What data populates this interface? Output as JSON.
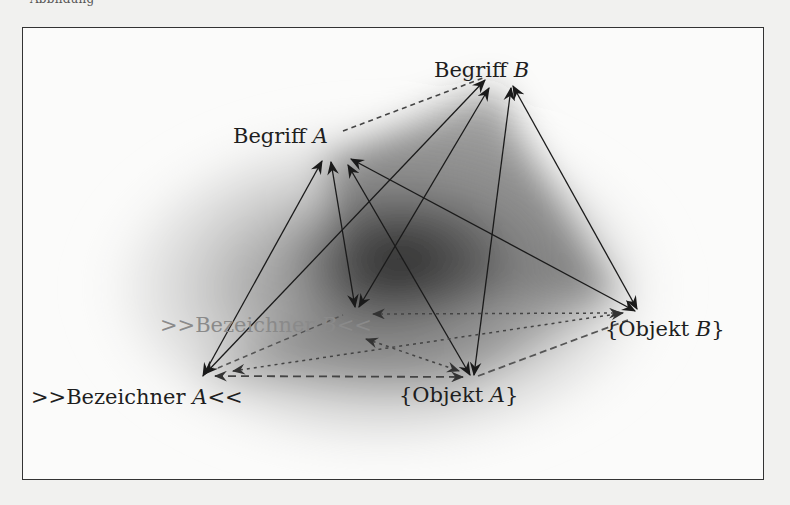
{
  "page": {
    "header_fragment": "Abbildung"
  },
  "diagram": {
    "nodes": {
      "begriff_a": {
        "text": "Begriff ",
        "var": "A"
      },
      "begriff_b": {
        "text": "Begriff ",
        "var": "B"
      },
      "bezeichner_a": {
        "prefix": ">>Bezeichner ",
        "var": "A",
        "suffix": "<<"
      },
      "bezeichner_b": {
        "prefix": ">>Bezeichner ",
        "var": "B",
        "suffix": "<<"
      },
      "objekt_a": {
        "prefix": "{Objekt ",
        "var": "A",
        "suffix": "}"
      },
      "objekt_b": {
        "prefix": "{Objekt ",
        "var": "B",
        "suffix": "}"
      }
    },
    "edges": [
      {
        "from": "Begriff A",
        "to": "Begriff B",
        "style": "dashed"
      },
      {
        "from": ">>Bezeichner A<<",
        "to": "Begriff A",
        "style": "solid",
        "arrows": "both"
      },
      {
        "from": ">>Bezeichner A<<",
        "to": "Begriff B",
        "style": "solid",
        "arrows": "both"
      },
      {
        "from": ">>Bezeichner B<<",
        "to": "Begriff A",
        "style": "solid",
        "arrows": "both"
      },
      {
        "from": ">>Bezeichner B<<",
        "to": "Begriff B",
        "style": "solid",
        "arrows": "both"
      },
      {
        "from": "{Objekt A}",
        "to": "Begriff A",
        "style": "solid",
        "arrows": "both"
      },
      {
        "from": "{Objekt A}",
        "to": "Begriff B",
        "style": "solid",
        "arrows": "both"
      },
      {
        "from": "{Objekt B}",
        "to": "Begriff A",
        "style": "solid",
        "arrows": "both"
      },
      {
        "from": "{Objekt B}",
        "to": "Begriff B",
        "style": "solid",
        "arrows": "both"
      },
      {
        "from": ">>Bezeichner A<<",
        "to": "{Objekt A}",
        "style": "dashed",
        "arrows": "both"
      },
      {
        "from": ">>Bezeichner A<<",
        "to": "{Objekt B}",
        "style": "dotted",
        "arrows": "both"
      },
      {
        "from": ">>Bezeichner A<<",
        "to": ">>Bezeichner B<<",
        "style": "dashed"
      },
      {
        "from": ">>Bezeichner B<<",
        "to": "{Objekt A}",
        "style": "dotted",
        "arrows": "both"
      },
      {
        "from": ">>Bezeichner B<<",
        "to": "{Objekt B}",
        "style": "dotted",
        "arrows": "both"
      },
      {
        "from": "{Objekt A}",
        "to": "{Objekt B}",
        "style": "dashed"
      }
    ]
  }
}
